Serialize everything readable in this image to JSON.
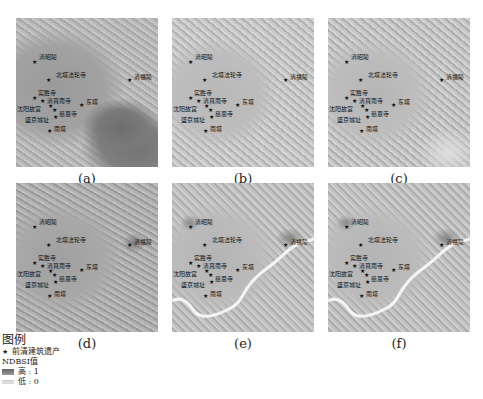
{
  "panels": [
    {
      "id": "a",
      "caption": "(a)",
      "x": 16,
      "y": 18,
      "river": false
    },
    {
      "id": "b",
      "caption": "(b)",
      "x": 172,
      "y": 18,
      "river": false
    },
    {
      "id": "c",
      "caption": "(c)",
      "x": 328,
      "y": 18,
      "river": false
    },
    {
      "id": "d",
      "caption": "(d)",
      "x": 16,
      "y": 183,
      "river": false
    },
    {
      "id": "e",
      "caption": "(e)",
      "x": 172,
      "y": 183,
      "river": true
    },
    {
      "id": "f",
      "caption": "(f)",
      "x": 328,
      "y": 183,
      "river": true
    }
  ],
  "sites": [
    {
      "name": "清昭陵",
      "x": 19,
      "y": 44,
      "label_dx": 4,
      "label_dy": -8
    },
    {
      "name": "北塔法轮寺",
      "x": 33,
      "y": 62,
      "label_dx": 7,
      "label_dy": -8
    },
    {
      "name": "清福陵",
      "x": 114,
      "y": 62,
      "label_dx": 4,
      "label_dy": -6
    },
    {
      "name": "实胜寺",
      "x": 19,
      "y": 80,
      "label_dx": 3,
      "label_dy": -8
    },
    {
      "name": "清真南寺",
      "x": 27,
      "y": 83,
      "label_dx": 4,
      "label_dy": -3
    },
    {
      "name": "沈阳故宫",
      "x": 35,
      "y": 88,
      "label_dx": -34,
      "label_dy": 0
    },
    {
      "name": "慈恩寺",
      "x": 39,
      "y": 92,
      "label_dx": 4,
      "label_dy": 1
    },
    {
      "name": "盛京城址",
      "x": 40,
      "y": 99,
      "label_dx": -31,
      "label_dy": 0
    },
    {
      "name": "东塔",
      "x": 66,
      "y": 87,
      "label_dx": 4,
      "label_dy": -6
    },
    {
      "name": "南塔",
      "x": 34,
      "y": 113,
      "label_dx": 4,
      "label_dy": -5
    }
  ],
  "legend": {
    "title": "图例",
    "marker_label": "前清建筑遗产",
    "index_name": "NDBSI值",
    "high_label": "高 : 1",
    "low_label": "低 : 0",
    "star_symbol": "★"
  }
}
